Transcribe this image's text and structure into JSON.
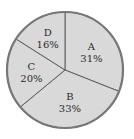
{
  "chart_data": {
    "type": "pie",
    "title": "",
    "categories": [
      "A",
      "B",
      "C",
      "D"
    ],
    "values": [
      31,
      33,
      20,
      16
    ],
    "labels": [
      "31%",
      "33%",
      "20%",
      "16%"
    ],
    "start_angle": "12 o'clock",
    "direction": "clockwise",
    "legend": "none",
    "colors": {
      "fill": "#d9d9d9",
      "stroke": "#555555",
      "outer_stroke": "#777777"
    }
  }
}
